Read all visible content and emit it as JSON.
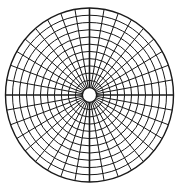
{
  "diagram": {
    "type": "polar-grid",
    "center": [
      89.5,
      95
    ],
    "radius_x": 84,
    "radius_y": 87,
    "inner_hole_ratio": 0.085,
    "ring_count": 11,
    "spoke_count": 36,
    "line_color": "#1a1a1a",
    "background": "#ffffff"
  }
}
